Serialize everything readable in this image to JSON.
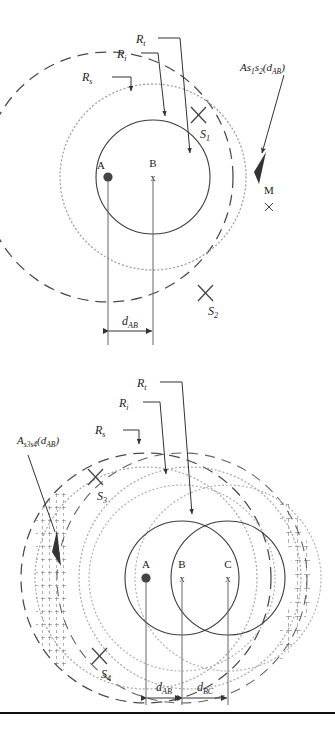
{
  "document": {
    "type": "technical-diagram",
    "panel_count": 2
  },
  "colors": {
    "ink": "#222222",
    "solid_circle": "#3c3c3c",
    "dashed_circle": "#4a4a4a",
    "dotted_circle": "#9a9a9a",
    "point_fill": "#444444",
    "hatch": "#555555",
    "rule": "#111111"
  },
  "figure_top": {
    "labels": {
      "r_t": "R",
      "r_t_sub": "t",
      "r_i": "R",
      "r_i_sub": "i",
      "r_s": "R",
      "r_s_sub": "s",
      "area_label": "As",
      "area_sub1": "1",
      "area_mid": "s",
      "area_sub2": "2",
      "area_arg": "(d",
      "area_arg_sub": "AB",
      "area_close": ")",
      "s1": "S",
      "s1_sub": "1",
      "s2": "S",
      "s2_sub": "2",
      "point_a": "A",
      "point_b": "B",
      "point_b_mark": "x",
      "region_m": "M",
      "region_m_mark": "x",
      "d_ab": "d",
      "d_ab_sub": "AB"
    },
    "geometry": {
      "center_a": {
        "x": 108,
        "y": 177,
        "marker": "filled-dot"
      },
      "center_b": {
        "x": 153,
        "y": 177,
        "marker": "x"
      },
      "r_t_radius": 57,
      "r_i_radius": 93,
      "r_s_radius": 125,
      "s1": {
        "x": 198,
        "y": 115
      },
      "s2": {
        "x": 205,
        "y": 292
      }
    }
  },
  "figure_bottom": {
    "labels": {
      "r_t": "R",
      "r_t_sub": "t",
      "r_i": "R",
      "r_i_sub": "i",
      "r_s": "R",
      "r_s_sub": "s",
      "area_label": "A",
      "area_sub": "s3s4",
      "area_arg": "(d",
      "area_arg_sub": "AB",
      "area_close": ")",
      "s3": "S",
      "s3_sub": "3",
      "s4": "S",
      "s4_sub": "4",
      "point_a": "A",
      "point_b": "B",
      "point_b_mark": "x",
      "point_c": "C",
      "point_c_mark": "x",
      "d_ab": "d",
      "d_ab_sub": "AB",
      "d_bc": "d",
      "d_bc_sub": "BC"
    },
    "geometry": {
      "center_a": {
        "x": 146,
        "y": 578,
        "marker": "filled-dot"
      },
      "center_b": {
        "x": 182,
        "y": 578,
        "marker": "x"
      },
      "center_c": {
        "x": 228,
        "y": 578,
        "marker": "x"
      },
      "r_t_radius": 57,
      "r_i_radius": 93,
      "r_s_radius": 125,
      "s3": {
        "x": 95,
        "y": 477
      },
      "s4": {
        "x": 99,
        "y": 655
      }
    }
  },
  "caption": {
    "line1": ""
  }
}
